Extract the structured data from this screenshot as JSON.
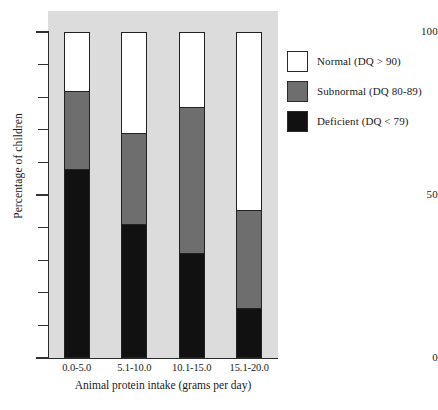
{
  "chart_data": {
    "type": "bar",
    "subtype": "stacked-bar-100-percent",
    "title": "",
    "xlabel": "Animal protein intake (grams per day)",
    "ylabel": "Percentage of children",
    "categories": [
      "0.0-5.0",
      "5.1-10.0",
      "10.1-15.0",
      "15.1-20.0"
    ],
    "series": [
      {
        "name": "Deficient (DQ < 79)",
        "values": [
          58,
          41,
          32,
          15
        ],
        "color": "#111111"
      },
      {
        "name": "Subnormal (DQ 80-89)",
        "values": [
          24,
          28,
          45,
          30
        ],
        "color": "#6e6e6e"
      },
      {
        "name": "Normal (DQ > 90)",
        "values": [
          18,
          31,
          23,
          55
        ],
        "color": "#ffffff"
      }
    ],
    "ylim": [
      0,
      100
    ],
    "y_major_ticks": [
      0,
      50,
      100
    ],
    "y_major_tick_labels": [
      "0",
      "50",
      "100"
    ],
    "y_minor_ticks": [
      10,
      20,
      30,
      40,
      60,
      70,
      80,
      90
    ],
    "grid": false,
    "legend_position": "right",
    "panel_background": "#dcdcdc"
  },
  "axes": {
    "y_title": "Percentage of children",
    "x_title": "Animal protein intake (grams per day)",
    "y_labels": [
      {
        "value": 100,
        "text": "100"
      },
      {
        "value": 50,
        "text": "50"
      },
      {
        "value": 0,
        "text": "0"
      }
    ],
    "x_labels": [
      "0.0-5.0",
      "5.1-10.0",
      "10.1-15.0",
      "15.1-20.0"
    ]
  },
  "legend": {
    "items": [
      {
        "label": "Normal (DQ > 90)",
        "swatch": "white"
      },
      {
        "label": "Subnormal (DQ 80-89)",
        "swatch": "gray"
      },
      {
        "label": "Deficient (DQ < 79)",
        "swatch": "black"
      }
    ]
  },
  "caption": {
    "fragment": ""
  },
  "colors": {
    "normal": "#ffffff",
    "subnormal": "#6e6e6e",
    "deficient": "#111111",
    "panel": "#dcdcdc",
    "axis": "#2a2a2a"
  }
}
